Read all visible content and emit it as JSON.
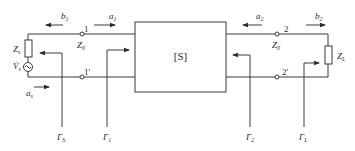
{
  "diagram": {
    "network_block": {
      "label": "[S]"
    },
    "ports": {
      "port1": {
        "top_terminal": "1",
        "bottom_terminal": "1′",
        "impedance": {
          "main": "Z",
          "sub": "0"
        }
      },
      "port2": {
        "top_terminal": "2",
        "bottom_terminal": "2′",
        "impedance": {
          "main": "Z",
          "sub": "0"
        }
      }
    },
    "source": {
      "impedance": {
        "main": "Z",
        "sub": "s"
      },
      "voltage": {
        "main": "V̇",
        "sub": "s"
      }
    },
    "load": {
      "impedance": {
        "main": "Z",
        "sub": "L"
      }
    },
    "waves": {
      "b1": {
        "main": "b",
        "sub": "1",
        "direction": "left"
      },
      "a1": {
        "main": "a",
        "sub": "1",
        "direction": "right"
      },
      "a2": {
        "main": "a",
        "sub": "2",
        "direction": "left"
      },
      "b2": {
        "main": "b",
        "sub": "2",
        "direction": "right"
      },
      "as": {
        "main": "a",
        "sub": "s",
        "direction": "right"
      }
    },
    "reflection_coefficients": [
      {
        "main": "Γ",
        "sub": "S"
      },
      {
        "main": "Γ",
        "sub": "1"
      },
      {
        "main": "Γ",
        "sub": "2"
      },
      {
        "main": "Γ",
        "sub": "L"
      }
    ]
  }
}
